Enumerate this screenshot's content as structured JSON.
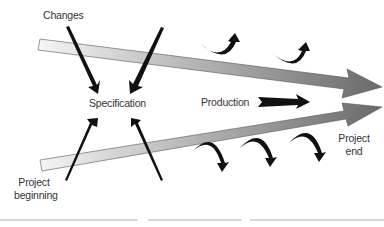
{
  "diagram": {
    "title": "",
    "labels": {
      "changes": "Changes",
      "specification": "Specification",
      "production": "Production",
      "project_beginning_line1": "Project",
      "project_beginning_line2": "beginning",
      "project_end_line1": "Project",
      "project_end_line2": "end"
    },
    "elements": {
      "upper_band": "wide gradient arrow from top-left converging to right",
      "lower_band": "wide gradient arrow from bottom-left converging to right",
      "change_arrows": 2,
      "beginning_arrows": 2,
      "production_arrow": 1,
      "curved_up_arrows": 2,
      "curved_down_arrows": 3
    },
    "colors": {
      "band_light": "#f2f2f2",
      "band_dark": "#6e6e6e",
      "arrow_black": "#111111",
      "text": "#333333",
      "rule": "#9a9a9a"
    }
  }
}
